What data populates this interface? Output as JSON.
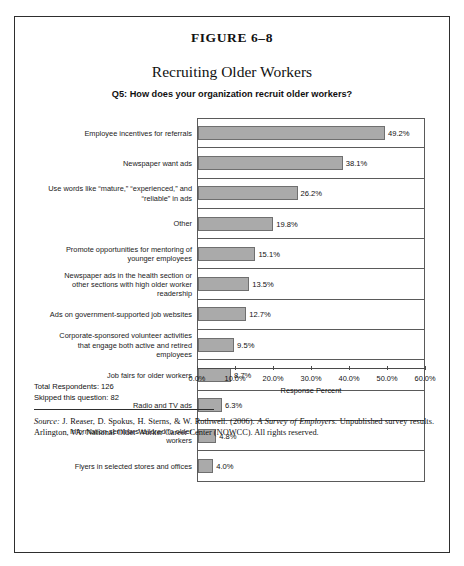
{
  "figure": {
    "number": "FIGURE 6–8",
    "title": "Recruiting Older Workers",
    "subtitle": "Q5: How does your organization recruit older workers?"
  },
  "chart_data": {
    "type": "bar",
    "orientation": "horizontal",
    "title": "Recruiting Older Workers",
    "subtitle": "Q5: How does your organization recruit older workers?",
    "xlabel": "Response Percent",
    "ylabel": "",
    "xlim": [
      0,
      60
    ],
    "xticks": [
      0,
      10,
      20,
      30,
      40,
      50,
      60
    ],
    "xtick_labels": [
      "0.0%",
      "10.0%",
      "20.0%",
      "30.0%",
      "40.0%",
      "50.0%",
      "60.0%"
    ],
    "grid": false,
    "legend": "none",
    "bar_color": "#aaaaaa",
    "categories": [
      "Employee incentives for referrals",
      "Newspaper want ads",
      "Use words like “mature,” “experienced,” and “reliable” in ads",
      "Other",
      "Promote opportunities for mentoring of younger employees",
      "Newspaper ads in the health section or other sections with high older worker readership",
      "Ads on government-supported job websites",
      "Corporate-sponsored volunteer activities that engage both active and retired employees",
      "Job fairs for older workers",
      "Radio and TV ads",
      "Information seminars tailored to older workers",
      "Flyers in selected stores and offices"
    ],
    "values": [
      49.2,
      38.1,
      26.2,
      19.8,
      15.1,
      13.5,
      12.7,
      9.5,
      8.7,
      6.3,
      4.8,
      4.0
    ],
    "value_labels": [
      "49.2%",
      "38.1%",
      "26.2%",
      "19.8%",
      "15.1%",
      "13.5%",
      "12.7%",
      "9.5%",
      "8.7%",
      "6.3%",
      "4.8%",
      "4.0%"
    ]
  },
  "categories_lines": [
    [
      "Employee incentives for referrals"
    ],
    [
      "Newspaper want ads"
    ],
    [
      "Use words like “mature,” “experienced,” and",
      "“reliable” in ads"
    ],
    [
      "Other"
    ],
    [
      "Promote opportunities for mentoring of",
      "younger employees"
    ],
    [
      "Newspaper ads in the health section or",
      "other sections with high older worker",
      "readership"
    ],
    [
      "Ads on government-supported job websites"
    ],
    [
      "Corporate-sponsored volunteer activities",
      "that engage both active and retired",
      "employees"
    ],
    [
      "Job fairs for older workers"
    ],
    [
      "Radio and TV ads"
    ],
    [
      "Information seminars tailored to older",
      "workers"
    ],
    [
      "Flyers in selected stores and offices"
    ]
  ],
  "stats": {
    "total_respondents": "Total Respondents: 126",
    "skipped": "Skipped this question: 82"
  },
  "source": {
    "label": "Source:",
    "text_before_italic": " J. Reaser, D. Spokus, H. Sterns, & W. Rothwell. (2006). ",
    "work_title": "A Survey of Employers.",
    "text_after": " Unpublished survey results. Arlington, VA: National Older Worker Career Center (NOWCC). All rights reserved."
  }
}
